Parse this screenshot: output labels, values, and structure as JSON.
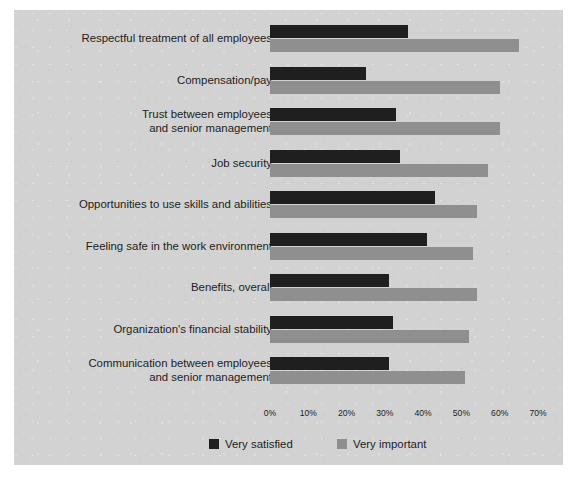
{
  "title": "satisfaction.",
  "colors": {
    "panel_background": "#d2d2d2",
    "very_satisfied": "#1f1f1f",
    "very_important": "#8f8f8f",
    "text": "#1d1d1d"
  },
  "legend": {
    "items": [
      {
        "label": "Very satisfied",
        "color": "#1f1f1f"
      },
      {
        "label": "Very important",
        "color": "#8f8f8f"
      }
    ]
  },
  "axis": {
    "ticks": [
      "0%",
      "10%",
      "20%",
      "30%",
      "40%",
      "50%",
      "60%",
      "70%"
    ]
  },
  "chart_data": {
    "type": "bar",
    "orientation": "horizontal",
    "title": "satisfaction.",
    "xlabel": "",
    "ylabel": "",
    "xlim": [
      0,
      70
    ],
    "xticks": [
      0,
      10,
      20,
      30,
      40,
      50,
      60,
      70
    ],
    "xtick_labels": [
      "0%",
      "10%",
      "20%",
      "30%",
      "40%",
      "50%",
      "60%",
      "70%"
    ],
    "grid": false,
    "legend_position": "bottom",
    "categories": [
      "Respectful treatment of all employees",
      "Compensation/pay",
      "Trust between employees\nand senior management",
      "Job security",
      "Opportunities to use skills and abilities",
      "Feeling safe in the work environment",
      "Benefits, overall",
      "Organization's financial stability",
      "Communication between employees\nand senior management"
    ],
    "series": [
      {
        "name": "Very satisfied",
        "color": "#1f1f1f",
        "values": [
          36,
          25,
          33,
          34,
          43,
          41,
          31,
          32,
          31
        ]
      },
      {
        "name": "Very important",
        "color": "#8f8f8f",
        "values": [
          65,
          60,
          60,
          57,
          54,
          53,
          54,
          52,
          51
        ]
      }
    ]
  }
}
